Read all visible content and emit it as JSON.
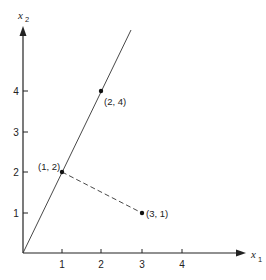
{
  "diagram": {
    "x_axis": {
      "label": "x",
      "subscript": "1",
      "ticks": [
        "1",
        "2",
        "3",
        "4"
      ]
    },
    "y_axis": {
      "label": "x",
      "subscript": "2",
      "ticks": [
        "1",
        "2",
        "3",
        "4"
      ]
    },
    "points": [
      {
        "label": "(2, 4)",
        "x": 2,
        "y": 4
      },
      {
        "label": "(1, 2)",
        "x": 1,
        "y": 2
      },
      {
        "label": "(3, 1)",
        "x": 3,
        "y": 1
      }
    ],
    "lines": [
      {
        "type": "solid",
        "description": "line through origin, x2 = 2 x1"
      },
      {
        "type": "dashed",
        "from": "(1, 2)",
        "to": "(3, 1)"
      }
    ],
    "colors": {
      "ink": "#222222",
      "background": "#ffffff"
    }
  }
}
